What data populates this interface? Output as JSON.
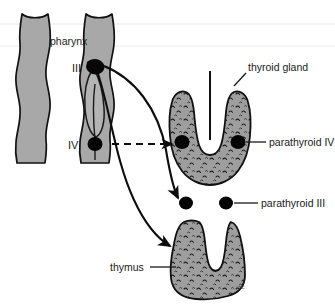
{
  "figure": {
    "signature": "vHc"
  },
  "labels": {
    "pharynx": "pharynx",
    "pouch_three": "III",
    "pouch_four": "IV",
    "thyroid_gland": "thyroid gland",
    "parathyroid_four": "parathyroid IV",
    "parathyroid_three": "parathyroid III",
    "thymus": "thymus"
  },
  "colors": {
    "background": "#ffffff",
    "tissue_gray": "#a8a8a8",
    "gland_gray": "#9a9a9a",
    "outline": "#111111",
    "text": "#1a1a1a",
    "dot_black": "#000000",
    "faint_line": "#efefef"
  },
  "structures": [
    {
      "name": "pharynx-left",
      "label": "pharynx",
      "fill": "#a8a8a8"
    },
    {
      "name": "pharynx-right",
      "label": "pharynx",
      "fill": "#a8a8a8"
    },
    {
      "name": "pharyngeal-pouch-iii",
      "label": "III",
      "marker": "black-dot"
    },
    {
      "name": "pharyngeal-pouch-iv",
      "label": "IV",
      "marker": "black-dot"
    },
    {
      "name": "thyroid-gland",
      "label": "thyroid gland",
      "fill": "#9a9a9a",
      "texture": "stippled"
    },
    {
      "name": "parathyroid-iv",
      "label": "parathyroid IV",
      "marker": "black-dot",
      "count": 2
    },
    {
      "name": "parathyroid-iii",
      "label": "parathyroid III",
      "marker": "black-dot",
      "count": 2
    },
    {
      "name": "thymus",
      "label": "thymus",
      "fill": "#9a9a9a",
      "texture": "stippled"
    }
  ],
  "arrows": [
    {
      "name": "pouch-iv-migration",
      "style": "dashed",
      "from": "pharyngeal-pouch-iv",
      "to": "parathyroid-iv"
    },
    {
      "name": "pouch-iii-to-parathyroid",
      "style": "solid-curved",
      "from": "pharyngeal-pouch-iii",
      "to": "parathyroid-iii"
    },
    {
      "name": "pouch-iii-to-thymus",
      "style": "solid-curved",
      "from": "pharyngeal-pouch-iii",
      "to": "thymus"
    }
  ]
}
